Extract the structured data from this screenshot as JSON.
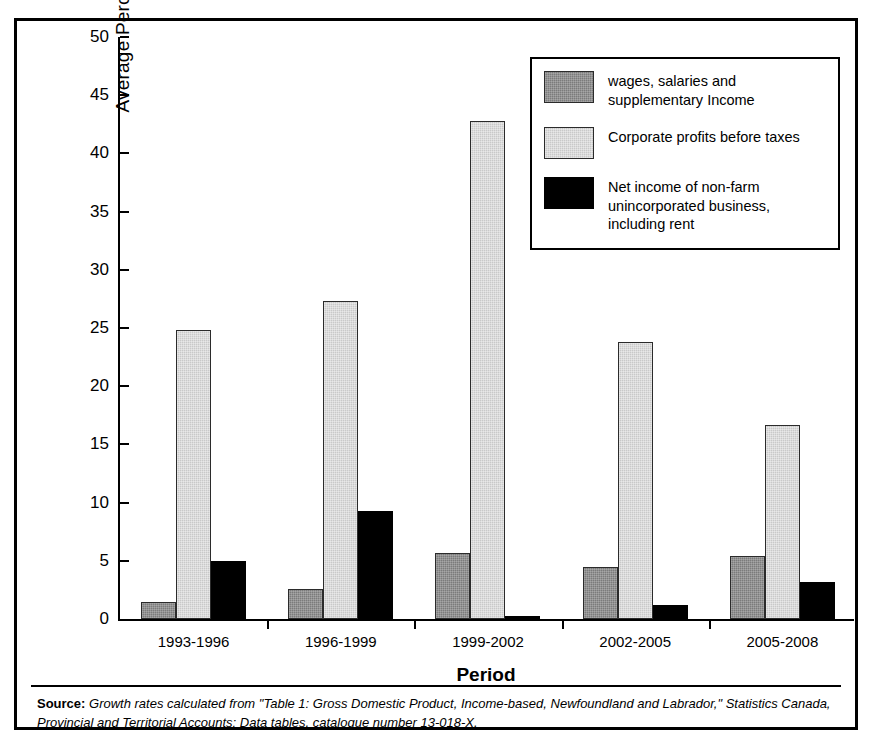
{
  "chart_data": {
    "type": "bar",
    "title": "",
    "xlabel": "Period",
    "ylabel": "Average Percentage Growth Rate",
    "ylim": [
      0,
      50
    ],
    "yticks": [
      0,
      5,
      10,
      15,
      20,
      25,
      30,
      35,
      40,
      45,
      50
    ],
    "grid": false,
    "legend_position": "top-right",
    "categories": [
      "1993-1996",
      "1996-1999",
      "1999-2002",
      "2002-2005",
      "2005-2008"
    ],
    "series": [
      {
        "name": "wages, salaries and supplementary Income",
        "color": "#7b7b7b",
        "values": [
          1.5,
          2.6,
          5.7,
          4.5,
          5.4
        ]
      },
      {
        "name": "Corporate profits before taxes",
        "color": "#c9c9c9",
        "values": [
          24.8,
          27.3,
          42.8,
          23.8,
          16.7
        ]
      },
      {
        "name": "Net income of non-farm unincorporated business, including rent",
        "color": "#000000",
        "values": [
          5.0,
          9.3,
          0.3,
          1.2,
          3.2
        ]
      }
    ]
  },
  "legend": {
    "entries": [
      {
        "label": "wages, salaries and supplementary Income",
        "swatch": "dark-grey-swatch"
      },
      {
        "label": "Corporate profits before taxes",
        "swatch": "light-grey-swatch"
      },
      {
        "label": "Net income of non-farm unincorporated business, including rent",
        "swatch": "black-swatch"
      }
    ]
  },
  "source": {
    "label": "Source:",
    "text": " Growth rates calculated from \"Table 1: Gross Domestic Product, Income-based, Newfoundland and Labrador,\" Statistics Canada, Provincial and Territorial Accounts: Data tables, catalogue number 13-018-X."
  }
}
